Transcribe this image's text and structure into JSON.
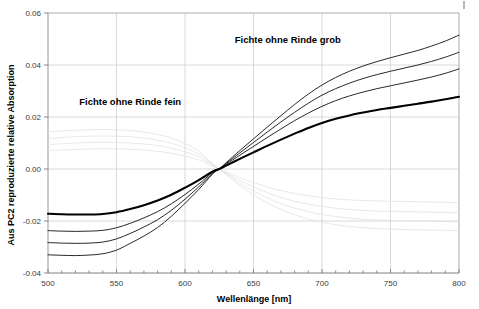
{
  "chart_data": {
    "type": "line",
    "title": "",
    "xlabel": "Wellenlänge [nm]",
    "ylabel": "Aus PC2 reproduzierte relative Absorption",
    "xlim": [
      500,
      800
    ],
    "ylim": [
      -0.04,
      0.06
    ],
    "xticks": [
      500,
      550,
      600,
      650,
      700,
      750,
      800
    ],
    "xtick_labels": [
      "500",
      "550",
      "600",
      "650",
      "700",
      "750",
      "800"
    ],
    "yticks": [
      -0.04,
      -0.02,
      0.0,
      0.02,
      0.04,
      0.06
    ],
    "ytick_labels": [
      "-0.04",
      "-0.02",
      "0.00",
      "0.02",
      "0.04",
      "0.06"
    ],
    "grid": true,
    "legend_position": "none",
    "annotations": [
      {
        "text": "Fichte ohne Rinde grob",
        "x": 675,
        "y": 0.0485,
        "name": "annotation-grob"
      },
      {
        "text": "Fichte ohne Rinde fein",
        "x": 560,
        "y": 0.0245,
        "name": "annotation-fein"
      }
    ],
    "crossing_point": {
      "x": 625,
      "y": 0.0
    },
    "x": [
      500,
      510,
      520,
      530,
      540,
      550,
      560,
      570,
      580,
      590,
      600,
      610,
      620,
      625,
      630,
      640,
      650,
      660,
      670,
      680,
      690,
      700,
      710,
      720,
      730,
      740,
      750,
      760,
      770,
      780,
      790,
      800
    ],
    "series": [
      {
        "name": "grob-1",
        "style": "dark-thin",
        "values": [
          -0.033,
          -0.0332,
          -0.0333,
          -0.0331,
          -0.0326,
          -0.0312,
          -0.0286,
          -0.0258,
          -0.0225,
          -0.0182,
          -0.0132,
          -0.0079,
          -0.002,
          0.0,
          0.0024,
          0.0071,
          0.0116,
          0.0161,
          0.0205,
          0.0248,
          0.0288,
          0.0323,
          0.0352,
          0.0376,
          0.0396,
          0.0413,
          0.0428,
          0.0442,
          0.0456,
          0.0473,
          0.0492,
          0.0515
        ]
      },
      {
        "name": "grob-2",
        "style": "dark-thin",
        "values": [
          -0.0283,
          -0.0285,
          -0.0286,
          -0.0285,
          -0.0281,
          -0.0269,
          -0.0248,
          -0.0223,
          -0.0195,
          -0.0159,
          -0.0116,
          -0.0069,
          -0.0017,
          0.0,
          0.0021,
          0.0062,
          0.0102,
          0.0142,
          0.0181,
          0.0218,
          0.0253,
          0.0284,
          0.0309,
          0.033,
          0.0348,
          0.0363,
          0.0376,
          0.0388,
          0.04,
          0.0414,
          0.043,
          0.0449
        ]
      },
      {
        "name": "grob-3",
        "style": "dark-thin",
        "values": [
          -0.0237,
          -0.0239,
          -0.024,
          -0.0239,
          -0.0236,
          -0.0226,
          -0.0209,
          -0.0188,
          -0.0164,
          -0.0134,
          -0.0098,
          -0.0058,
          -0.0014,
          0.0,
          0.0018,
          0.0053,
          0.0087,
          0.0121,
          0.0154,
          0.0186,
          0.0215,
          0.0241,
          0.0263,
          0.0281,
          0.0296,
          0.0309,
          0.032,
          0.0331,
          0.0342,
          0.0354,
          0.0368,
          0.0385
        ]
      },
      {
        "name": "fein-bold",
        "style": "dark-bold",
        "values": [
          -0.0172,
          -0.0174,
          -0.0175,
          -0.0175,
          -0.0173,
          -0.0166,
          -0.0154,
          -0.0139,
          -0.0121,
          -0.0099,
          -0.0072,
          -0.0043,
          -0.001,
          0.0,
          0.0013,
          0.0039,
          0.0064,
          0.0089,
          0.0113,
          0.0136,
          0.0158,
          0.0177,
          0.0193,
          0.0206,
          0.0217,
          0.0227,
          0.0235,
          0.0243,
          0.0251,
          0.0259,
          0.0268,
          0.0278
        ]
      },
      {
        "name": "fein-faint-1",
        "style": "faint",
        "values": [
          0.0142,
          0.0146,
          0.0149,
          0.0151,
          0.0152,
          0.0151,
          0.0148,
          0.0142,
          0.0133,
          0.0119,
          0.0098,
          0.0069,
          0.0022,
          0.0,
          -0.0022,
          -0.0063,
          -0.0099,
          -0.013,
          -0.0155,
          -0.0176,
          -0.0192,
          -0.0205,
          -0.0214,
          -0.0221,
          -0.0226,
          -0.0229,
          -0.0231,
          -0.0233,
          -0.0234,
          -0.0235,
          -0.0236,
          -0.0237
        ]
      },
      {
        "name": "fein-faint-2",
        "style": "faint",
        "values": [
          0.0117,
          0.0121,
          0.0124,
          0.0126,
          0.0127,
          0.0126,
          0.0124,
          0.0119,
          0.0111,
          0.0099,
          0.0082,
          0.0058,
          0.0019,
          0.0,
          -0.0019,
          -0.0054,
          -0.0085,
          -0.0111,
          -0.0133,
          -0.015,
          -0.0164,
          -0.0175,
          -0.0183,
          -0.0189,
          -0.0193,
          -0.0196,
          -0.0198,
          -0.0199,
          -0.02,
          -0.0201,
          -0.0202,
          -0.0203
        ]
      },
      {
        "name": "fein-faint-3",
        "style": "faint",
        "values": [
          0.0094,
          0.0097,
          0.01,
          0.0102,
          0.0103,
          0.0102,
          0.01,
          0.0096,
          0.009,
          0.008,
          0.0066,
          0.0047,
          0.0015,
          0.0,
          -0.0015,
          -0.0044,
          -0.0069,
          -0.0091,
          -0.0109,
          -0.0124,
          -0.0135,
          -0.0144,
          -0.0151,
          -0.0156,
          -0.0159,
          -0.0162,
          -0.0163,
          -0.0164,
          -0.0165,
          -0.0166,
          -0.0167,
          -0.0168
        ]
      },
      {
        "name": "fein-faint-4",
        "style": "faint",
        "values": [
          0.0071,
          0.0073,
          0.0075,
          0.0077,
          0.0078,
          0.0077,
          0.0076,
          0.0073,
          0.0068,
          0.0061,
          0.005,
          0.0035,
          0.0011,
          0.0,
          -0.0011,
          -0.0033,
          -0.0052,
          -0.0069,
          -0.0083,
          -0.0094,
          -0.0103,
          -0.011,
          -0.0115,
          -0.0119,
          -0.0121,
          -0.0123,
          -0.0124,
          -0.0125,
          -0.0126,
          -0.0127,
          -0.0128,
          -0.0129
        ]
      }
    ]
  },
  "colors": {
    "curve_dark": "#111111",
    "curve_bold": "#000000",
    "curve_faint": "#e2e2e2",
    "grid": "#c9c9c9",
    "axis": "#8a8a8a",
    "text": "#000000"
  }
}
